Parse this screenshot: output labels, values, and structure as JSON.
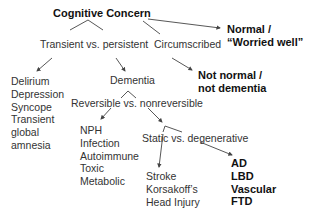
{
  "diagram": {
    "root": {
      "label": "Cognitive Concern"
    },
    "nodes": {
      "normal": {
        "line1": "Normal /",
        "line2": "“Worried well”"
      },
      "transient_vs_persistent": {
        "label": "Transient vs. persistent"
      },
      "circumscribed": {
        "label": "Circumscribed"
      },
      "not_normal": {
        "line1": "Not normal /",
        "line2": "not dementia"
      },
      "transient_causes": {
        "items": [
          "Delirium",
          "Depression",
          "Syncope",
          "Transient",
          "global",
          "amnesia"
        ]
      },
      "dementia": {
        "label": "Dementia"
      },
      "reversible_vs_nonreversible": {
        "label": "Reversible vs. nonreversible"
      },
      "reversible_causes": {
        "items": [
          "NPH",
          "Infection",
          "Autoimmune",
          "Toxic",
          "Metabolic"
        ]
      },
      "static_vs_degenerative": {
        "label": "Static vs. degenerative"
      },
      "static_causes": {
        "items": [
          "Stroke",
          "Korsakoff’s",
          "Head Injury"
        ]
      },
      "degenerative_causes": {
        "items": [
          "AD",
          "LBD",
          "Vascular",
          "FTD"
        ]
      }
    },
    "colors": {
      "text": "#333333",
      "bold_text": "#111111",
      "lines": "#444444",
      "background": "#ffffff"
    }
  }
}
